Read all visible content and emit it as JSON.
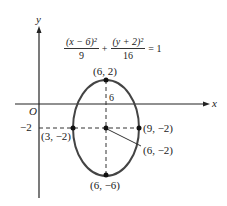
{
  "axes": {
    "x_label": "x",
    "y_label": "y",
    "origin_label": "O",
    "y_tick_label": "−2"
  },
  "equation": {
    "term1_num": "(x − 6)²",
    "term1_den": "9",
    "plus": "+",
    "term2_num": "(y + 2)²",
    "term2_den": "16",
    "rhs": "= 1"
  },
  "points": {
    "top": "(6, 2)",
    "bottom": "(6, −6)",
    "left": "(3, −2)",
    "right": "(9, −2)",
    "center": "(6, −2)"
  },
  "annotations": {
    "axis_length_label": "6"
  },
  "ellipse": {
    "center": [
      6,
      -2
    ],
    "a": 3,
    "b": 4,
    "stroke": "#444444"
  }
}
